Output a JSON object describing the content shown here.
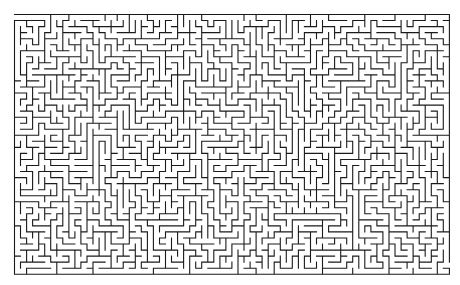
{
  "maze": {
    "origin_x": 14.5,
    "origin_y": 14.5,
    "cols": 72,
    "rows": 43,
    "cell_size": 6.04,
    "wall_color": "#1a1a1a",
    "background": "#ffffff",
    "stroke_width": 1.1,
    "entrance": {
      "side": "left",
      "row": 0
    },
    "exit": {
      "side": "right",
      "row": 41
    },
    "seed": 20240611
  }
}
